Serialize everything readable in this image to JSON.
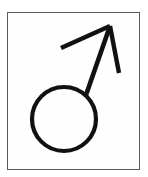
{
  "image": {
    "kind": "pictogram",
    "subject": "male-gender-symbol",
    "caption": "Mars symbol: circle with diagonal arrow pointing to the upper right",
    "unicode_glyph": "♂",
    "background_color": "#ffffff"
  },
  "frame": {
    "name": "border-frame",
    "stroke_color": "#5a5a5a",
    "fill_color": "#fefefe",
    "stroke_width": 1.4,
    "x": 7,
    "y": 12,
    "width": 133,
    "height": 158
  },
  "symbol": {
    "stroke_color": "#111111",
    "circle": {
      "center_x": 64,
      "center_y": 119,
      "radius": 32,
      "stroke_width": 4.2
    },
    "shaft": {
      "x1": 86,
      "y1": 95,
      "x2": 110,
      "y2": 26,
      "stroke_width": 4.6
    },
    "arrowhead_left_barb": {
      "x1": 110,
      "y1": 26,
      "x2": 61,
      "y2": 48,
      "stroke_width": 4.4
    },
    "arrowhead_right_barb": {
      "x1": 110,
      "y1": 26,
      "x2": 119,
      "y2": 73,
      "stroke_width": 4.4
    }
  }
}
